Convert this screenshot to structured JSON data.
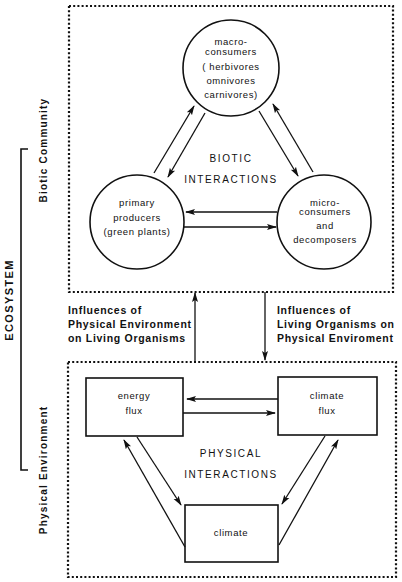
{
  "diagram": {
    "type": "ecosystem-structure",
    "side_labels": {
      "ecosystem": "ECOSYSTEM",
      "biotic_community": "Biotic Community",
      "physical_environment": "Physical Environment"
    },
    "biotic": {
      "center_label": [
        "BIOTIC",
        "INTERACTIONS"
      ],
      "nodes": {
        "macro": [
          "macro-",
          "consumers",
          "( herbivores",
          "omnivores",
          "carnivores)"
        ],
        "primary": [
          "primary",
          "producers",
          "(green plants)"
        ],
        "micro": [
          "micro-",
          "consumers",
          "and",
          "decomposers"
        ]
      }
    },
    "influences": {
      "up": [
        "Influences of",
        "Physical Environment",
        "on Living Organisms"
      ],
      "down": [
        "Influences of",
        "Living Organisms on",
        "Physical Enviroment"
      ]
    },
    "physical": {
      "center_label": [
        "PHYSICAL",
        "INTERACTIONS"
      ],
      "nodes": {
        "energy_flux": [
          "energy",
          "flux"
        ],
        "climate_flux": [
          "climate",
          "flux"
        ],
        "climate": [
          "climate"
        ]
      }
    },
    "colors": {
      "ink": "#111111",
      "background": "#ffffff"
    }
  }
}
